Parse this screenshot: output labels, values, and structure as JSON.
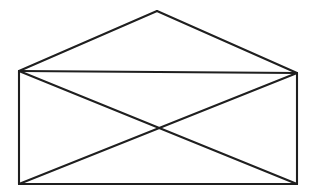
{
  "document": {
    "title": "Envelope Figure",
    "kind": "line-drawing",
    "description": "Unicursal envelope puzzle figure: rectangle with both diagonals and a triangular flap above",
    "background_color": "#ffffff",
    "stroke_color": "#1f1f1f",
    "stroke_width": 2.1,
    "canvas": {
      "width": 315,
      "height": 195
    }
  },
  "figure": {
    "name": "envelope",
    "vertices": [
      {
        "id": "apex",
        "label": "A",
        "x": 157,
        "y": 11
      },
      {
        "id": "top-left",
        "label": "B",
        "x": 19,
        "y": 71
      },
      {
        "id": "top-right",
        "label": "C",
        "x": 297,
        "y": 73
      },
      {
        "id": "bottom-left",
        "label": "D",
        "x": 19,
        "y": 184
      },
      {
        "id": "bottom-right",
        "label": "E",
        "x": 297,
        "y": 184
      },
      {
        "id": "center-cross",
        "label": "X",
        "x": 158,
        "y": 127
      }
    ],
    "edges": [
      {
        "id": "roof-left",
        "from": "top-left",
        "to": "apex",
        "points": "19,71 157,11"
      },
      {
        "id": "roof-right",
        "from": "apex",
        "to": "top-right",
        "points": "157,11 297,73"
      },
      {
        "id": "top-edge",
        "from": "top-left",
        "to": "top-right",
        "points": "19,71 297,73"
      },
      {
        "id": "left-edge",
        "from": "top-left",
        "to": "bottom-left",
        "points": "19,71 19,184"
      },
      {
        "id": "right-edge",
        "from": "top-right",
        "to": "bottom-right",
        "points": "297,73 297,184"
      },
      {
        "id": "bottom-edge",
        "from": "bottom-left",
        "to": "bottom-right",
        "points": "19,184 297,184"
      },
      {
        "id": "diagonal-tlbr",
        "from": "top-left",
        "to": "bottom-right",
        "points": "19,71 297,184"
      },
      {
        "id": "diagonal-bltr",
        "from": "bottom-left",
        "to": "top-right",
        "points": "19,184 297,73"
      }
    ],
    "counts": {
      "vertices": 5,
      "edges": 8
    }
  }
}
